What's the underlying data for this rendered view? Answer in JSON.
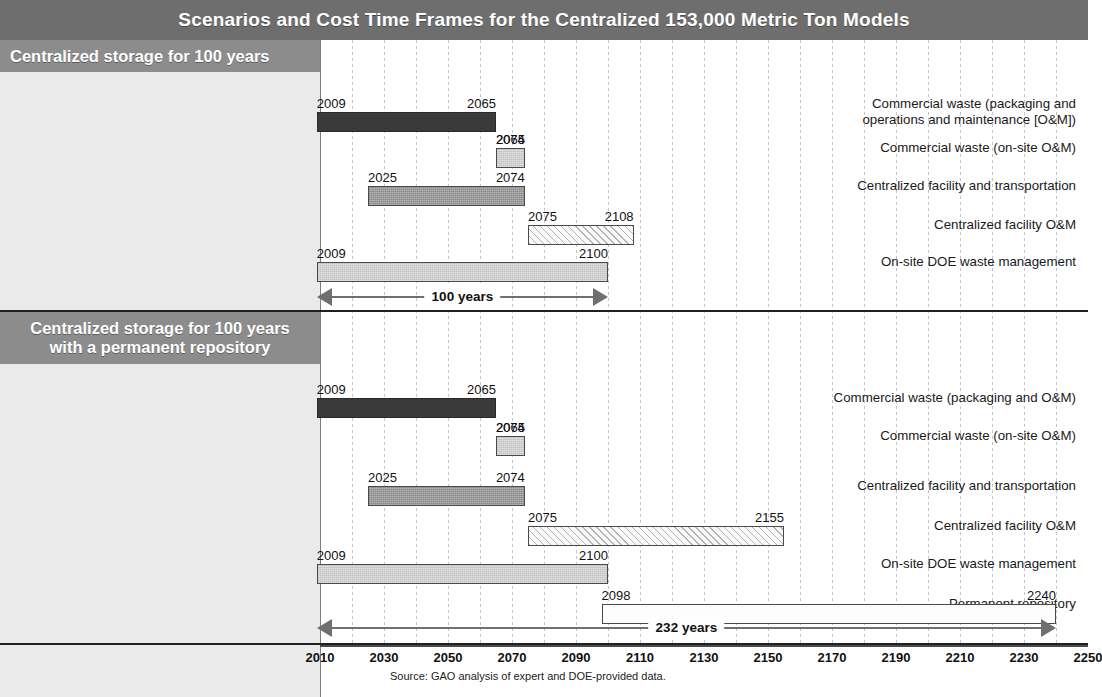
{
  "title": "Scenarios and Cost Time Frames for the Centralized 153,000 Metric Ton Models",
  "source": "Source: GAO analysis of expert and DOE-provided data.",
  "colors": {
    "title_bar": "#6e6e6e",
    "panel_header": "#8c8c8c",
    "panel_body": "#eaeaea",
    "bar_dark": "#3a3a3a",
    "bar_mid": "#9a9a9a",
    "bar_light": "#cfcfcf",
    "arrow": "#6f6f6f",
    "gridline": "#b9b9c8"
  },
  "axis": {
    "min": 2010,
    "max": 2250,
    "step": 20,
    "grid_step": 10,
    "ticks": [
      2010,
      2030,
      2050,
      2070,
      2090,
      2110,
      2130,
      2150,
      2170,
      2190,
      2210,
      2230,
      2250
    ]
  },
  "scenarios": [
    {
      "header": "Centralized storage for 100 years",
      "header_lines": [
        "Centralized storage for 100 years"
      ],
      "span": {
        "label": "100 years",
        "start": 2009,
        "end": 2100
      },
      "rows": [
        {
          "label": "Commercial waste (packaging and operations and maintenance [O&M])",
          "label_lines": [
            "Commercial waste (packaging and",
            "operations and maintenance [O&M])"
          ],
          "start": 2009,
          "end": 2065,
          "start_label": "2009",
          "end_label": "2065",
          "fill": "dark"
        },
        {
          "label": "Commercial waste (on-site O&M)",
          "label_lines": [
            "Commercial waste (on-site O&M)"
          ],
          "start": 2065,
          "end": 2074,
          "start_label": "2065",
          "end_label": "2074",
          "fill": "light"
        },
        {
          "label": "Centralized facility and transportation",
          "label_lines": [
            "Centralized facility and transportation"
          ],
          "start": 2025,
          "end": 2074,
          "start_label": "2025",
          "end_label": "2074",
          "fill": "mid"
        },
        {
          "label": "Centralized facility O&M",
          "label_lines": [
            "Centralized facility O&M"
          ],
          "start": 2075,
          "end": 2108,
          "start_label": "2075",
          "end_label": "2108",
          "fill": "hatch"
        },
        {
          "label": "On-site DOE waste management",
          "label_lines": [
            "On-site DOE waste management"
          ],
          "start": 2009,
          "end": 2100,
          "start_label": "2009",
          "end_label": "2100",
          "fill": "light"
        }
      ]
    },
    {
      "header": "Centralized storage for 100 years with a permanent repository",
      "header_lines": [
        "Centralized storage for 100 years",
        "with a permanent repository"
      ],
      "span": {
        "label": "232 years",
        "start": 2009,
        "end": 2240
      },
      "rows": [
        {
          "label": "Commercial waste (packaging and O&M)",
          "label_lines": [
            "Commercial waste (packaging and O&M)"
          ],
          "start": 2009,
          "end": 2065,
          "start_label": "2009",
          "end_label": "2065",
          "fill": "dark"
        },
        {
          "label": "Commercial waste (on-site O&M)",
          "label_lines": [
            "Commercial waste (on-site O&M)"
          ],
          "start": 2065,
          "end": 2074,
          "start_label": "2065",
          "end_label": "2074",
          "fill": "light"
        },
        {
          "label": "Centralized facility and transportation",
          "label_lines": [
            "Centralized facility and transportation"
          ],
          "start": 2025,
          "end": 2074,
          "start_label": "2025",
          "end_label": "2074",
          "fill": "mid"
        },
        {
          "label": "Centralized facility O&M",
          "label_lines": [
            "Centralized facility O&M"
          ],
          "start": 2075,
          "end": 2155,
          "start_label": "2075",
          "end_label": "2155",
          "fill": "hatch"
        },
        {
          "label": "On-site DOE waste management",
          "label_lines": [
            "On-site DOE waste management"
          ],
          "start": 2009,
          "end": 2100,
          "start_label": "2009",
          "end_label": "2100",
          "fill": "light"
        },
        {
          "label": "Permanent repository",
          "label_lines": [
            "Permanent repository"
          ],
          "start": 2098,
          "end": 2240,
          "start_label": "2098",
          "end_label": "2240",
          "fill": "open"
        }
      ]
    }
  ],
  "chart_data": {
    "type": "bar",
    "title": "Scenarios and Cost Time Frames for the Centralized 153,000 Metric Ton Models",
    "xlabel": "",
    "ylabel": "",
    "xlim": [
      2010,
      2250
    ],
    "grid": true,
    "legend": "none",
    "note": "Horizontal Gantt-style timeline; each bar is an activity spanning start year to end year.",
    "groups": [
      {
        "name": "Centralized storage for 100 years",
        "total_span_years": 100,
        "total_span_label": "100 years",
        "categories": [
          "Commercial waste (packaging and operations and maintenance [O&M])",
          "Commercial waste (on-site O&M)",
          "Centralized facility and transportation",
          "Centralized facility O&M",
          "On-site DOE waste management"
        ],
        "start": [
          2009,
          2065,
          2025,
          2075,
          2009
        ],
        "end": [
          2065,
          2074,
          2074,
          2108,
          2100
        ],
        "duration": [
          56,
          9,
          49,
          33,
          91
        ]
      },
      {
        "name": "Centralized storage for 100 years with a permanent repository",
        "total_span_years": 232,
        "total_span_label": "232 years",
        "categories": [
          "Commercial waste (packaging and O&M)",
          "Commercial waste (on-site O&M)",
          "Centralized facility and transportation",
          "Centralized facility O&M",
          "On-site DOE waste management",
          "Permanent repository"
        ],
        "start": [
          2009,
          2065,
          2025,
          2075,
          2009,
          2098
        ],
        "end": [
          2065,
          2074,
          2074,
          2155,
          2100,
          2240
        ],
        "duration": [
          56,
          9,
          49,
          80,
          91,
          142
        ]
      }
    ]
  }
}
